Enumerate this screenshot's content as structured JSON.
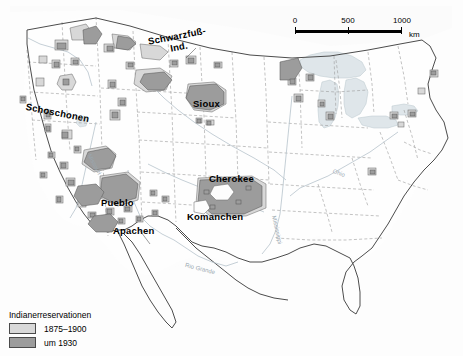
{
  "map": {
    "title": "Indianerreservationen in den USA",
    "region": "United States",
    "tribe_labels": [
      {
        "name": "Schwarzfuß-Ind.",
        "line1": "Schwarzfuß-",
        "line2": "Ind."
      },
      {
        "name": "Schoschonen"
      },
      {
        "name": "Sioux"
      },
      {
        "name": "Pueblo"
      },
      {
        "name": "Apachen"
      },
      {
        "name": "Cherokee"
      },
      {
        "name": "Komanchen"
      }
    ],
    "river_labels": [
      {
        "name": "Rio Grande"
      },
      {
        "name": "Missouri"
      },
      {
        "name": "Mississippi"
      },
      {
        "name": "Ohio"
      }
    ],
    "colors": {
      "reservation_1875_1900": "#d4d4d4",
      "reservation_1930": "#9a9a9a",
      "water": "#dfe6ea",
      "land": "#fefefe",
      "coastline": "#4c4c4c",
      "state_border": "#8d8d8d",
      "outline": "#4a4a4a"
    }
  },
  "scalebar": {
    "ticks": [
      "0",
      "500",
      "1000"
    ],
    "unit": "km"
  },
  "legend": {
    "title": "Indianerreservationen",
    "items": [
      {
        "label": "1875–1900",
        "color": "#d4d4d4"
      },
      {
        "label": "um 1930",
        "color": "#9a9a9a"
      }
    ]
  }
}
